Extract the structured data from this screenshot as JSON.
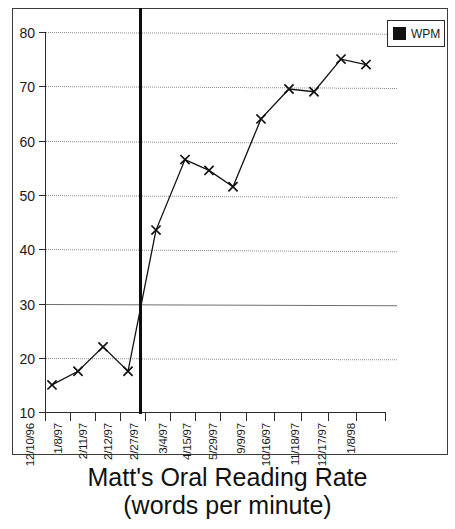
{
  "chart_data": {
    "type": "line",
    "title": "Matt's Oral Reading Rate",
    "subtitle": "(words per minute)",
    "xlabel": "",
    "ylabel": "",
    "ylim": [
      10,
      80
    ],
    "ytick_step": 10,
    "yticks": [
      80,
      70,
      60,
      50,
      40,
      30,
      20,
      10
    ],
    "grid": true,
    "grid_style": "dotted",
    "legend_position": "top-right",
    "categories": [
      "12/10/96",
      "1/8/97",
      "2/11/97",
      "2/12/97",
      "2/27/97",
      "3/4/97",
      "4/15/97",
      "5/29/97",
      "9/9/97",
      "10/16/97",
      "11/18/97",
      "12/17/97",
      "1/8/98"
    ],
    "series": [
      {
        "name": "WPM",
        "marker": "x",
        "color": "#111111",
        "values": [
          15,
          17.5,
          22,
          17.5,
          43.5,
          56.5,
          54.5,
          51.5,
          64,
          69.5,
          69,
          75,
          74
        ]
      }
    ],
    "annotations": [
      {
        "type": "vertical-phase-line",
        "name": "intervention-line",
        "after_category": "2/12/97",
        "color": "#0d0d0d"
      }
    ]
  },
  "legend": {
    "entries": [
      {
        "label": "WPM",
        "swatch_color": "#111111"
      }
    ]
  },
  "colors": {
    "axis": "#2b2b2b",
    "grid": "#8d8d8d",
    "line": "#111111",
    "frame": "#3c3c3c"
  }
}
